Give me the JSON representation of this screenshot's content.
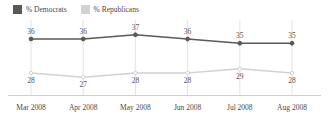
{
  "legend": {
    "position": "top-left",
    "entries": [
      {
        "label": "% Democrats",
        "color": "#595959",
        "icon": "legend-swatch-icon"
      },
      {
        "label": "% Republicans",
        "color": "#d2d2d2",
        "icon": "legend-swatch-icon"
      }
    ]
  },
  "chart_data": {
    "type": "line",
    "title": "",
    "subtitle": "",
    "xlabel": "",
    "ylabel": "",
    "grid": "vertical",
    "legend_position": "top-left",
    "ylim": [
      24,
      40
    ],
    "categories": [
      "Mar 2008",
      "Apr 2008",
      "May 2008",
      "Jun 2008",
      "Jul 2008",
      "Aug 2008"
    ],
    "series": [
      {
        "name": "% Democrats",
        "color": "#595959",
        "values": [
          36,
          36,
          37,
          36,
          35,
          35
        ],
        "labels": [
          "36",
          "36",
          "37",
          "36",
          "35",
          "35"
        ]
      },
      {
        "name": "% Republicans",
        "color": "#d2d2d2",
        "values": [
          28,
          27,
          28,
          28,
          29,
          28
        ],
        "labels": [
          "28",
          "27",
          "28",
          "28",
          "29",
          "28"
        ]
      }
    ]
  },
  "axis": {
    "tick_labels": [
      "Mar 2008",
      "Apr 2008",
      "May 2008",
      "Jun 2008",
      "Jul 2008",
      "Aug 2008"
    ]
  }
}
